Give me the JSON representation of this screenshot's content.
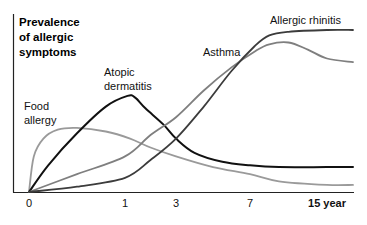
{
  "chart_data": {
    "type": "line",
    "title": [
      "Prevalence",
      "of allergic",
      "symptoms"
    ],
    "xlabel": "year",
    "ylabel": "Prevalence of allergic symptoms",
    "x_ticks": [
      {
        "value": 0,
        "label": "0"
      },
      {
        "value": 1,
        "label": "1"
      },
      {
        "value": 3,
        "label": "3"
      },
      {
        "value": 7,
        "label": "7"
      },
      {
        "value": 15,
        "label": "15 year"
      }
    ],
    "x_scale": "nonlinear (age)",
    "xlim": [
      0,
      17
    ],
    "ylim": [
      0,
      100
    ],
    "y_units": "relative prevalence (no tick labels shown)",
    "grid": false,
    "legend": "inline labels",
    "series": [
      {
        "name": "Food allergy",
        "label_lines": [
          "Food",
          "allergy"
        ],
        "color": "#9a9a9a",
        "points": [
          [
            0,
            0
          ],
          [
            0.05,
            20
          ],
          [
            0.15,
            30
          ],
          [
            0.3,
            35
          ],
          [
            0.5,
            36
          ],
          [
            0.8,
            34
          ],
          [
            1.2,
            30
          ],
          [
            2,
            25
          ],
          [
            3,
            20
          ],
          [
            5,
            14
          ],
          [
            7,
            10
          ],
          [
            10,
            6
          ],
          [
            15,
            4
          ],
          [
            17,
            4
          ]
        ]
      },
      {
        "name": "Atopic dermatitis",
        "label_lines": [
          "Atopic",
          "dermatitis"
        ],
        "color": "#111111",
        "points": [
          [
            0,
            0
          ],
          [
            0.2,
            15
          ],
          [
            0.5,
            33
          ],
          [
            0.8,
            48
          ],
          [
            1.1,
            54
          ],
          [
            1.4,
            53
          ],
          [
            1.8,
            47
          ],
          [
            2.5,
            38
          ],
          [
            3,
            30
          ],
          [
            4,
            22
          ],
          [
            5.5,
            17
          ],
          [
            7,
            15
          ],
          [
            10,
            14
          ],
          [
            15,
            14
          ],
          [
            17,
            14
          ]
        ]
      },
      {
        "name": "Asthma",
        "label_lines": [
          "Asthma"
        ],
        "color": "#7f7f7f",
        "points": [
          [
            0,
            0
          ],
          [
            0.5,
            10
          ],
          [
            1,
            20
          ],
          [
            2,
            32
          ],
          [
            3,
            42
          ],
          [
            4.5,
            57
          ],
          [
            6,
            70
          ],
          [
            7.5,
            79
          ],
          [
            9,
            83
          ],
          [
            11,
            84
          ],
          [
            13,
            80
          ],
          [
            15,
            75
          ],
          [
            17,
            73
          ]
        ]
      },
      {
        "name": "Allergic rhinitis",
        "label_lines": [
          "Allergic rhinitis"
        ],
        "color": "#3c3c3c",
        "points": [
          [
            0,
            0
          ],
          [
            0.5,
            3
          ],
          [
            1,
            8
          ],
          [
            2,
            18
          ],
          [
            3,
            30
          ],
          [
            4.5,
            48
          ],
          [
            6,
            68
          ],
          [
            7.5,
            82
          ],
          [
            9,
            88
          ],
          [
            11,
            90
          ],
          [
            15,
            91
          ],
          [
            17,
            91
          ]
        ]
      }
    ]
  }
}
